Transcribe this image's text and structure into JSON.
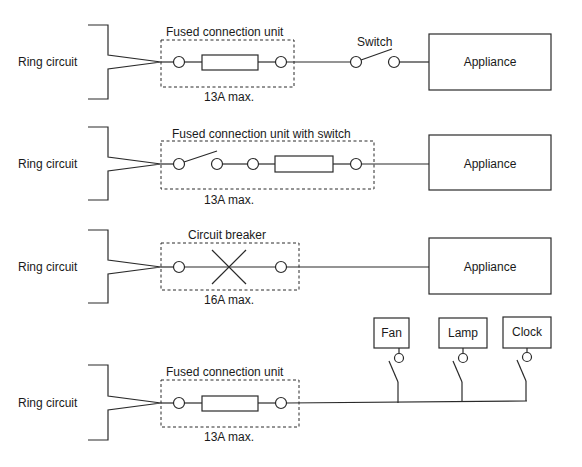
{
  "diagram": {
    "colors": {
      "line": "#2a2a2a",
      "text": "#1a1a1a",
      "background": "#ffffff"
    },
    "rows": [
      {
        "source_label": "Ring circuit",
        "device_label": "Fused connection unit",
        "rating_label": "13A max.",
        "switch_label": "Switch",
        "load_label": "Appliance"
      },
      {
        "source_label": "Ring circuit",
        "device_label": "Fused connection unit with switch",
        "rating_label": "13A max.",
        "load_label": "Appliance"
      },
      {
        "source_label": "Ring circuit",
        "device_label": "Circuit breaker",
        "rating_label": "16A max.",
        "load_label": "Appliance"
      },
      {
        "source_label": "Ring circuit",
        "device_label": "Fused connection unit",
        "rating_label": "13A max.",
        "loads": [
          {
            "label": "Fan"
          },
          {
            "label": "Lamp"
          },
          {
            "label": "Clock"
          }
        ]
      }
    ]
  }
}
